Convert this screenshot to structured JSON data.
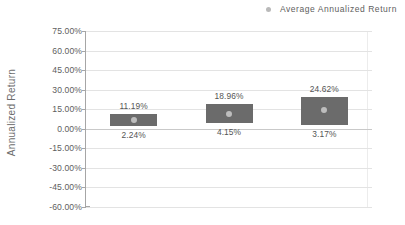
{
  "chart_data": {
    "type": "bar",
    "subtype": "floating-range-bar",
    "title": "",
    "xlabel": "",
    "ylabel": "Annualized Return",
    "ylim": [
      -60,
      75
    ],
    "ytick_step": 15,
    "ytick_labels": [
      "75.00%",
      "60.00%",
      "45.00%",
      "30.00%",
      "15.00%",
      "0.00%",
      "-15.00%",
      "-30.00%",
      "-45.00%",
      "-60.00%"
    ],
    "ytick_values": [
      75,
      60,
      45,
      30,
      15,
      0,
      -15,
      -30,
      -45,
      -60
    ],
    "grid": "horizontal",
    "legend_position": "top-right",
    "legend": [
      {
        "name": "Average Annualized Return",
        "marker": "circle",
        "color": "#bdbdbd"
      }
    ],
    "categories": [
      "1",
      "2",
      "3"
    ],
    "series": [
      {
        "name": "Return Range",
        "color": "#6b6b6b",
        "top_label_name": "High",
        "bottom_label_name": "Low",
        "values_high": [
          11.19,
          18.96,
          24.62
        ],
        "values_low": [
          2.24,
          4.15,
          3.17
        ],
        "labels_high": [
          "11.19%",
          "18.96%",
          "24.62%"
        ],
        "labels_low": [
          "2.24%",
          "4.15%",
          "3.17%"
        ]
      },
      {
        "name": "Average Annualized Return",
        "color": "#bdbdbd",
        "marker": "circle",
        "values": [
          6.7,
          11.5,
          14.5
        ]
      }
    ],
    "colors": {
      "bar": "#6b6b6b",
      "marker": "#bdbdbd",
      "grid": "#e3e3e3",
      "zero_line": "#c9c9c9",
      "axis": "#a6a6a6",
      "text": "#5a5a5a",
      "background": "#ffffff"
    }
  }
}
